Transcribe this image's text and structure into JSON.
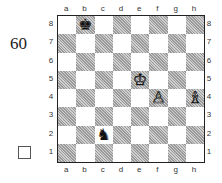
{
  "problem": {
    "number": "60",
    "solve_box": ""
  },
  "board": {
    "files": [
      "a",
      "b",
      "c",
      "d",
      "e",
      "f",
      "g",
      "h"
    ],
    "ranks": [
      "8",
      "7",
      "6",
      "5",
      "4",
      "3",
      "2",
      "1"
    ],
    "light_color": "#ffffff",
    "dark_color": "#b4b4b4",
    "pieces": [
      {
        "square": "b8",
        "color": "black",
        "type": "king",
        "glyph": "♚"
      },
      {
        "square": "e5",
        "color": "white",
        "type": "king",
        "glyph": "♔"
      },
      {
        "square": "f4",
        "color": "white",
        "type": "pawn",
        "glyph": "♙"
      },
      {
        "square": "h4",
        "color": "white",
        "type": "bishop",
        "glyph": "♗"
      },
      {
        "square": "c2",
        "color": "black",
        "type": "knight",
        "glyph": "♞"
      }
    ]
  }
}
